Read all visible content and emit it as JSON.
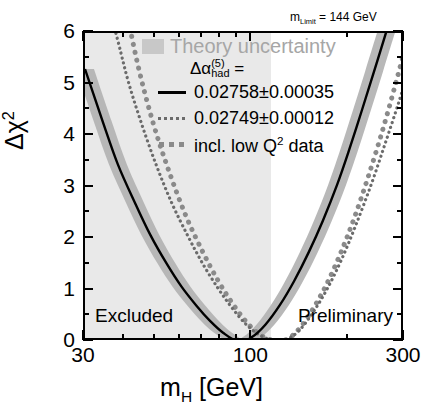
{
  "chart_data": {
    "type": "line",
    "title": "",
    "xlabel": "m_H [GeV]",
    "ylabel": "Δχ²",
    "xscale": "log",
    "xlim": [
      30,
      300
    ],
    "ylim": [
      0,
      6
    ],
    "grid": false,
    "legend_position": "upper-center",
    "x_ticks_major": [
      30,
      100,
      300
    ],
    "x_tick_labels": [
      "30",
      "100",
      "300"
    ],
    "x_ticks_minor": [
      40,
      50,
      60,
      70,
      80,
      90,
      200
    ],
    "y_ticks_major": [
      0,
      1,
      2,
      3,
      4,
      5,
      6
    ],
    "y_tick_labels": [
      "0",
      "1",
      "2",
      "3",
      "4",
      "5",
      "6"
    ],
    "y_ticks_minor": [
      0.5,
      1.5,
      2.5,
      3.5,
      4.5,
      5.5
    ],
    "series": [
      {
        "name": "0.02758±00.00035",
        "style": "solid",
        "color": "#000000",
        "minimum_x": 91,
        "minimum_y": 0,
        "points": [
          [
            30,
            5.3
          ],
          [
            34,
            4.3
          ],
          [
            38,
            3.45
          ],
          [
            43,
            2.7
          ],
          [
            48,
            2.08
          ],
          [
            54,
            1.52
          ],
          [
            60,
            1.08
          ],
          [
            67,
            0.7
          ],
          [
            74,
            0.4
          ],
          [
            81,
            0.18
          ],
          [
            91,
            0.0
          ],
          [
            100,
            0.1
          ],
          [
            110,
            0.34
          ],
          [
            122,
            0.72
          ],
          [
            135,
            1.18
          ],
          [
            150,
            1.74
          ],
          [
            166,
            2.35
          ],
          [
            184,
            3.05
          ],
          [
            200,
            3.7
          ],
          [
            220,
            4.5
          ],
          [
            240,
            5.25
          ],
          [
            260,
            5.95
          ],
          [
            268,
            6.2
          ]
        ]
      },
      {
        "name": "0.02749±00.00012",
        "style": "dotted-fine",
        "color": "#6b6b6b",
        "points": [
          [
            30,
            8.5
          ],
          [
            34,
            7.0
          ],
          [
            38,
            5.85
          ],
          [
            41,
            5.05
          ],
          [
            45,
            4.25
          ],
          [
            50,
            3.45
          ],
          [
            56,
            2.7
          ],
          [
            63,
            2.05
          ],
          [
            70,
            1.52
          ],
          [
            78,
            1.05
          ],
          [
            86,
            0.68
          ],
          [
            95,
            0.36
          ],
          [
            105,
            0.14
          ],
          [
            118,
            0.02
          ],
          [
            128,
            0.05
          ],
          [
            140,
            0.22
          ],
          [
            155,
            0.58
          ],
          [
            172,
            1.05
          ],
          [
            190,
            1.6
          ],
          [
            210,
            2.25
          ],
          [
            235,
            3.05
          ],
          [
            260,
            3.85
          ],
          [
            285,
            4.6
          ],
          [
            300,
            5.05
          ]
        ]
      },
      {
        "name": "incl. low Q² data",
        "style": "dotted-thick",
        "color": "#8a8a8a",
        "points": [
          [
            30,
            12.0
          ],
          [
            33,
            9.8
          ],
          [
            36,
            8.2
          ],
          [
            40,
            6.6
          ],
          [
            44,
            5.35
          ],
          [
            49,
            4.25
          ],
          [
            55,
            3.3
          ],
          [
            62,
            2.45
          ],
          [
            70,
            1.75
          ],
          [
            78,
            1.2
          ],
          [
            86,
            0.78
          ],
          [
            94,
            0.45
          ],
          [
            102,
            0.22
          ],
          [
            110,
            0.08
          ],
          [
            118,
            0.02
          ],
          [
            124,
            0.02
          ],
          [
            132,
            0.1
          ],
          [
            142,
            0.3
          ],
          [
            155,
            0.65
          ],
          [
            170,
            1.1
          ],
          [
            188,
            1.7
          ],
          [
            208,
            2.4
          ],
          [
            230,
            3.2
          ],
          [
            255,
            4.1
          ],
          [
            280,
            5.0
          ],
          [
            300,
            5.7
          ]
        ]
      }
    ],
    "bands": [
      {
        "name": "theory-uncertainty-band",
        "color": "#b4b4b4",
        "description": "shaded band around the solid central curve"
      },
      {
        "name": "excluded-region",
        "color": "#e9e9e9",
        "x_range": [
          30,
          114
        ],
        "description": "light shaded region to the left of the direct search limit"
      }
    ],
    "annotations": [
      {
        "name": "m-limit",
        "text": "m_Limit = 144 GeV",
        "x": 200,
        "y": 6.2
      },
      {
        "name": "excluded",
        "text": "Excluded",
        "x": 35,
        "y": 0.45
      },
      {
        "name": "preliminary",
        "text": "Preliminary",
        "x": 250,
        "y": 0.45
      }
    ]
  },
  "axes": {
    "y_title_delta": "Δχ",
    "y_title_exp": "2",
    "x_title_m": "m",
    "x_title_sub": "H",
    "x_title_unit": " [GeV]",
    "y_tick_labels": [
      "6",
      "5",
      "4",
      "3",
      "2",
      "1",
      "0"
    ],
    "x_tick_labels": [
      "30",
      "100",
      "300"
    ]
  },
  "legend": {
    "theory_label": "Theory uncertainty",
    "alpha_symbol": "Δα",
    "alpha_sup": "(5)",
    "alpha_sub": "had",
    "alpha_equals": " =",
    "entries": [
      {
        "key": "solid",
        "label": "0.02758±0.00035"
      },
      {
        "key": "fine",
        "label": "0.02749±0.00012"
      },
      {
        "key": "thick",
        "label": "incl. low Q"
      },
      {
        "key": "thick_sup",
        "label": "2"
      },
      {
        "key": "thick_tail",
        "label": " data"
      }
    ]
  },
  "annotations": {
    "mlimit_m": "m",
    "mlimit_sub": "Limit",
    "mlimit_value": " = 144 GeV",
    "excluded": "Excluded",
    "preliminary": "Preliminary"
  },
  "colors": {
    "curve_solid": "#000000",
    "curve_fine_dotted": "#6b6b6b",
    "curve_thick_dotted": "#8a8a8a",
    "theory_band": "#b4b4b4",
    "excluded_region": "#e9e9e9",
    "legend_theory_text": "#a6a6a6",
    "frame": "#000000"
  }
}
